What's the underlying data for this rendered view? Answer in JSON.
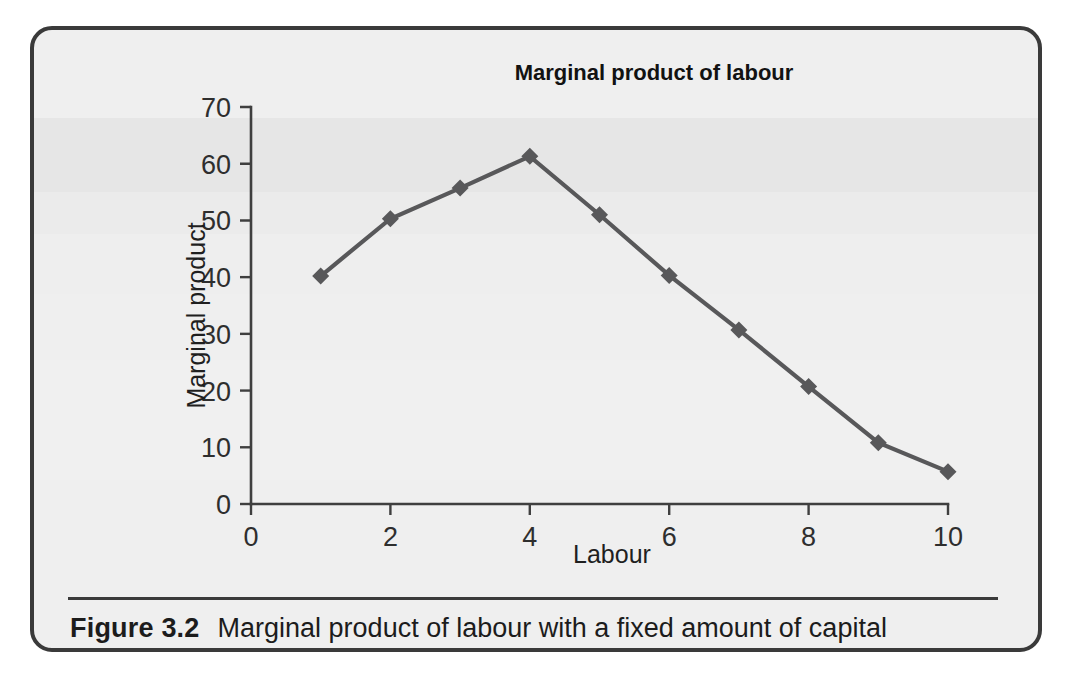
{
  "figure": {
    "label": "Figure 3.2",
    "caption": "Marginal product of labour with a fixed amount of capital"
  },
  "chart_data": {
    "type": "line",
    "title": "Marginal product of labour",
    "xlabel": "Labour",
    "ylabel": "Marginal product",
    "x": [
      1,
      2,
      3,
      4,
      5,
      6,
      7,
      8,
      9,
      10
    ],
    "values": [
      40.2,
      50.3,
      55.7,
      61.3,
      51.0,
      40.3,
      30.7,
      20.7,
      10.8,
      5.7
    ],
    "series": [
      {
        "name": "Marginal product of labour",
        "values": [
          40.2,
          50.3,
          55.7,
          61.3,
          51.0,
          40.3,
          30.7,
          20.7,
          10.8,
          5.7
        ]
      }
    ],
    "xlim": [
      0,
      10
    ],
    "ylim": [
      0,
      70
    ],
    "xticks": [
      0,
      2,
      4,
      6,
      8,
      10
    ],
    "yticks": [
      0,
      10,
      20,
      30,
      40,
      50,
      60,
      70
    ],
    "xtick_labels": [
      "0",
      "2",
      "4",
      "6",
      "8",
      "10"
    ],
    "ytick_labels": [
      "0",
      "10",
      "20",
      "30",
      "40",
      "50",
      "60",
      "70"
    ],
    "grid": false,
    "legend": false,
    "marker": "diamond",
    "line_color": "#58585a",
    "marker_color": "#58585a",
    "plot_background": "#efefef"
  },
  "colors": {
    "border": "#3a3a3a",
    "background": "#efefef",
    "axis": "#3f3f3f",
    "text": "#1c1c1c"
  }
}
